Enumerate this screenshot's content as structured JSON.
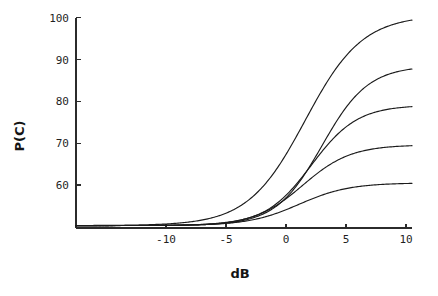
{
  "chart_data": {
    "type": "line",
    "title": "",
    "subtitle": "",
    "xlabel": "dB",
    "ylabel": "P(C)",
    "xlim": [
      -17.5,
      10.5
    ],
    "ylim": [
      49.5,
      102
    ],
    "grid": false,
    "legend": "none",
    "x_ticks": [
      -10,
      -5,
      0,
      5,
      10
    ],
    "x_tick_labels": [
      "-10",
      "-5",
      "0",
      "5",
      "10"
    ],
    "y_ticks": [
      60,
      70,
      80,
      90,
      100
    ],
    "y_tick_labels": [
      "60",
      "70",
      "80",
      "90",
      "100"
    ],
    "annotations": [],
    "series": [
      {
        "name": "curve-1",
        "asymptote_low": 50.3,
        "asymptote_high": 100.6,
        "midpoint_db": 1.6,
        "slope": 0.42,
        "x": [
          -17.5,
          -16,
          -14,
          -12,
          -10,
          -8,
          -6,
          -5,
          -4,
          -3,
          -2,
          -1,
          0,
          1,
          2,
          3,
          4,
          5,
          6,
          7,
          8,
          9,
          10
        ],
        "y": [
          50.4,
          50.6,
          51.0,
          51.7,
          53.0,
          55.2,
          58.9,
          61.5,
          64.7,
          68.6,
          73.1,
          78.1,
          83.1,
          87.8,
          91.8,
          94.9,
          97.1,
          98.6,
          99.5,
          100.1,
          100.4,
          100.5,
          100.6
        ]
      },
      {
        "name": "curve-2",
        "asymptote_low": 50.3,
        "asymptote_high": 88.5,
        "midpoint_db": 3.0,
        "slope": 0.52,
        "x": [
          -17.5,
          -16,
          -14,
          -12,
          -10,
          -8,
          -6,
          -5,
          -4,
          -3,
          -2,
          -1,
          0,
          1,
          2,
          3,
          4,
          5,
          6,
          7,
          8,
          9,
          10
        ],
        "y": [
          50.3,
          50.4,
          50.5,
          50.8,
          51.3,
          52.2,
          53.9,
          55.2,
          57.0,
          59.4,
          62.5,
          66.3,
          70.6,
          75.1,
          79.3,
          82.8,
          85.4,
          87.0,
          87.9,
          88.3,
          88.4,
          88.5,
          88.5
        ]
      },
      {
        "name": "curve-3",
        "asymptote_low": 50.3,
        "asymptote_high": 79.1,
        "midpoint_db": 2.1,
        "slope": 0.52,
        "x": [
          -17.5,
          -16,
          -14,
          -12,
          -10,
          -8,
          -6,
          -5,
          -4,
          -3,
          -2,
          -1,
          0,
          1,
          2,
          3,
          4,
          5,
          6,
          7,
          8,
          9,
          10
        ],
        "y": [
          50.3,
          50.4,
          50.5,
          50.8,
          51.3,
          52.3,
          54.1,
          55.5,
          57.4,
          59.9,
          62.9,
          66.3,
          69.8,
          73.0,
          75.6,
          77.3,
          78.3,
          78.8,
          79.0,
          79.1,
          79.1,
          79.1,
          79.1
        ]
      },
      {
        "name": "curve-4",
        "asymptote_low": 50.3,
        "asymptote_high": 69.6,
        "midpoint_db": 1.4,
        "slope": 0.5,
        "x": [
          -17.5,
          -16,
          -14,
          -12,
          -10,
          -8,
          -6,
          -5,
          -4,
          -3,
          -2,
          -1,
          0,
          1,
          2,
          3,
          4,
          5,
          6,
          7,
          8,
          9,
          10
        ],
        "y": [
          50.3,
          50.4,
          50.6,
          50.9,
          51.5,
          52.5,
          54.3,
          55.6,
          57.2,
          59.2,
          61.4,
          63.7,
          65.8,
          67.4,
          68.5,
          69.1,
          69.4,
          69.5,
          69.6,
          69.6,
          69.6,
          69.6,
          69.6
        ]
      },
      {
        "name": "curve-5",
        "asymptote_low": 50.3,
        "asymptote_high": 60.5,
        "midpoint_db": 1.1,
        "slope": 0.48,
        "x": [
          -17.5,
          -16,
          -14,
          -12,
          -10,
          -8,
          -6,
          -5,
          -4,
          -3,
          -2,
          -1,
          0,
          1,
          2,
          3,
          4,
          5,
          6,
          7,
          8,
          9,
          10
        ],
        "y": [
          50.3,
          50.4,
          50.6,
          50.9,
          51.4,
          52.2,
          53.4,
          54.2,
          55.1,
          56.1,
          57.2,
          58.2,
          59.1,
          59.8,
          60.2,
          60.4,
          60.5,
          60.5,
          60.5,
          60.5,
          60.5,
          60.5,
          60.5
        ]
      }
    ]
  },
  "axis": {
    "y_title": "P(C)",
    "x_title": "dB"
  }
}
